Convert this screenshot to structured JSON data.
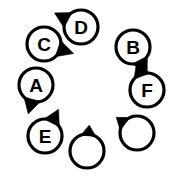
{
  "diagram": {
    "type": "node-ring",
    "canvas": {
      "width": 182,
      "height": 177
    },
    "background_color": "#ffffff",
    "stroke_color": "#000000",
    "fill_color": "#ffffff",
    "ring": {
      "center_x": 88,
      "center_y": 88,
      "radius": 58,
      "node_radius": 17,
      "node_count": 8
    },
    "nodes": [
      {
        "id": "node-d",
        "label": "D",
        "cx": 81,
        "cy": 27,
        "r": 17,
        "wedge_angle": 208,
        "wedge_spread": 30,
        "wedge_length": 13,
        "has_label": true
      },
      {
        "id": "node-b",
        "label": "B",
        "cx": 133,
        "cy": 47,
        "r": 17,
        "wedge_angle": 62,
        "wedge_spread": 30,
        "wedge_length": 13,
        "has_label": true
      },
      {
        "id": "node-f",
        "label": "F",
        "cx": 147,
        "cy": 90,
        "r": 17,
        "wedge_angle": 250,
        "wedge_spread": 30,
        "wedge_length": 13,
        "has_label": true
      },
      {
        "id": "node-empty-right",
        "label": "",
        "cx": 137,
        "cy": 133,
        "r": 17,
        "wedge_angle": 217,
        "wedge_spread": 28,
        "wedge_length": 9,
        "has_label": false
      },
      {
        "id": "node-empty-bottom",
        "label": "",
        "cx": 87,
        "cy": 151,
        "r": 17,
        "wedge_angle": 275,
        "wedge_spread": 26,
        "wedge_length": 9,
        "has_label": false
      },
      {
        "id": "node-e",
        "label": "E",
        "cx": 45,
        "cy": 136,
        "r": 17,
        "wedge_angle": 297,
        "wedge_spread": 30,
        "wedge_length": 13,
        "has_label": true
      },
      {
        "id": "node-a",
        "label": "A",
        "cx": 36,
        "cy": 85,
        "r": 17,
        "wedge_angle": 105,
        "wedge_spread": 30,
        "wedge_length": 13,
        "has_label": true
      },
      {
        "id": "node-c",
        "label": "C",
        "cx": 44,
        "cy": 44,
        "r": 17,
        "wedge_angle": 18,
        "wedge_spread": 30,
        "wedge_length": 14,
        "has_label": true
      }
    ]
  }
}
